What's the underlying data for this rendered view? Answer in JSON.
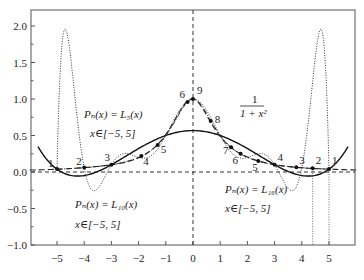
{
  "chart_data": {
    "type": "line",
    "title": "",
    "xlabel": "",
    "ylabel": "",
    "xlim": [
      -6.3,
      6.0
    ],
    "ylim": [
      -1.0,
      2.2
    ],
    "grid": false,
    "x_ticks": [
      -5,
      -4,
      -3,
      -2,
      -1,
      0,
      1,
      2,
      3,
      4,
      5
    ],
    "x_tick_labels": [
      "−5",
      "−4",
      "−3",
      "−2",
      "−1",
      "0",
      "1",
      "2",
      "3",
      "4",
      "5"
    ],
    "y_ticks": [
      2.0,
      1.5,
      1.0,
      0.5,
      0.0,
      -0.5,
      -1.0
    ],
    "y_tick_labels": [
      "2.0",
      "1.5",
      "1.0",
      "0.5",
      "0.0",
      "−0.5",
      "−1.0"
    ],
    "series": [
      {
        "name": "1/(1+x^2)",
        "style": "dash-dot",
        "function": "runge",
        "node_labels": [
          "1",
          "2",
          "3",
          "4",
          "5",
          "6",
          "9",
          "8",
          "7",
          "6",
          "5",
          "4",
          "3",
          "2",
          "1"
        ]
      },
      {
        "name": "L5(x)",
        "style": "solid",
        "nodes_x": [
          -5,
          -3,
          -1,
          1,
          3,
          5
        ],
        "peak_at_0": 0.5
      },
      {
        "name": "L10(x)",
        "style": "dotted",
        "nodes_x": [
          -5,
          -4,
          -3,
          -2,
          -1,
          0,
          1,
          2,
          3,
          4,
          5
        ],
        "max_value": 1.92,
        "min_value": -0.3
      },
      {
        "name": "L16(x)",
        "style": "dashed",
        "approximates": "1/(1+x^2)"
      }
    ],
    "node_points": [
      {
        "label": "1",
        "x": -5.0,
        "y": 0.04
      },
      {
        "label": "2",
        "x": -4.0,
        "y": 0.06
      },
      {
        "label": "3",
        "x": -3.0,
        "y": 0.1
      },
      {
        "label": "4",
        "x": -1.9,
        "y": 0.22
      },
      {
        "label": "5",
        "x": -1.3,
        "y": 0.37
      },
      {
        "label": "6",
        "x": -0.2,
        "y": 0.96
      },
      {
        "label": "9",
        "x": 0.0,
        "y": 1.0
      },
      {
        "label": "8",
        "x": 0.65,
        "y": 0.7
      },
      {
        "label": "7",
        "x": 1.4,
        "y": 0.34
      },
      {
        "label": "6",
        "x": 1.75,
        "y": 0.25
      },
      {
        "label": "5",
        "x": 2.4,
        "y": 0.15
      },
      {
        "label": "4",
        "x": 3.0,
        "y": 0.1
      },
      {
        "label": "3",
        "x": 3.8,
        "y": 0.065
      },
      {
        "label": "2",
        "x": 4.4,
        "y": 0.05
      },
      {
        "label": "1",
        "x": 5.0,
        "y": 0.04
      }
    ],
    "annotations": [
      {
        "id": "l5-label",
        "line1": "Pₙ(x) = L₅(x)",
        "line2": "x∈[−5, 5]"
      },
      {
        "id": "l10-label",
        "line1": "Pₙ(x) = L₁₀(x)",
        "line2": "x∈[−5, 5]"
      },
      {
        "id": "l16-label",
        "line1": "Pₙ(x) = L₁₆(x)",
        "line2": "x∈[−5, 5]"
      },
      {
        "id": "runge-label",
        "numerator": "1",
        "denominator": "1 + x²"
      }
    ]
  },
  "labels": {
    "l5_line1": "Pₙ(x) = L₅(x)",
    "l5_line2": "x∈[−5, 5]",
    "l10_line1": "Pₙ(x) = L₁₀(x)",
    "l10_line2": "x∈[−5, 5]",
    "l16_line1": "Pₙ(x) = L₁₆(x)",
    "l16_line2": "x∈[−5, 5]",
    "runge_num": "1",
    "runge_den": "1 + x²"
  }
}
